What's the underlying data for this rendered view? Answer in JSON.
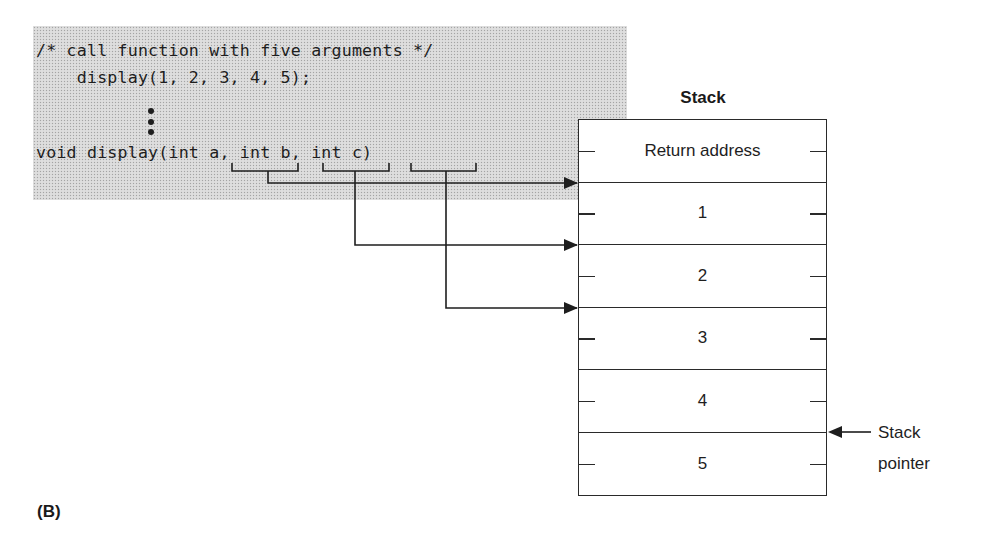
{
  "code": {
    "lines": [
      "/* call function with five arguments */",
      "    display(1, 2, 3, 4, 5);",
      "void display(int a, int b, int c)"
    ],
    "ellipsis": "vertical-ellipsis",
    "params": [
      "int a",
      "int b",
      "int c"
    ]
  },
  "stack": {
    "title": "Stack",
    "rows": [
      "Return address",
      "1",
      "2",
      "3",
      "4",
      "5"
    ],
    "pointer_label_line1": "Stack",
    "pointer_label_line2": "pointer",
    "pointer_at_row": 5
  },
  "arrows": [
    {
      "from": "int a",
      "to_row": 1
    },
    {
      "from": "int b",
      "to_row": 2
    },
    {
      "from": "int c",
      "to_row": 3
    }
  ],
  "figure_label": "(B)",
  "colors": {
    "code_background": "#d9d9d9",
    "line": "#2a2a2a",
    "text": "#1e1e1e"
  }
}
